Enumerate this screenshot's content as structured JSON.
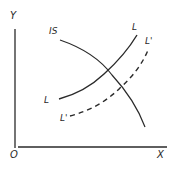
{
  "diagram": {
    "type": "IS-LM curve shift diagram",
    "axes": {
      "y_label": "Y",
      "x_label": "X",
      "origin_label": "O"
    },
    "curves": [
      {
        "name": "IS",
        "label": "IS",
        "style": "solid",
        "slope": "downward"
      },
      {
        "name": "L",
        "label_start": "L",
        "label_end": "L",
        "style": "solid",
        "slope": "upward"
      },
      {
        "name": "L'",
        "label_start": "L'",
        "label_end": "L'",
        "style": "dashed",
        "slope": "upward"
      }
    ],
    "colors": {
      "ink": "#2a2a2a",
      "background": "#ffffff"
    }
  }
}
